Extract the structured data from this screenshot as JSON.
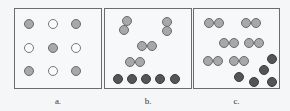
{
  "figure": {
    "panels": [
      {
        "id": "a",
        "label": "a.",
        "box": {
          "left": 14,
          "width": 88
        },
        "particles": [
          {
            "x": 14,
            "y": 15,
            "type": "gray"
          },
          {
            "x": 38,
            "y": 15,
            "type": "white"
          },
          {
            "x": 61,
            "y": 15,
            "type": "gray"
          },
          {
            "x": 14,
            "y": 39,
            "type": "white"
          },
          {
            "x": 38,
            "y": 39,
            "type": "gray"
          },
          {
            "x": 61,
            "y": 39,
            "type": "white"
          },
          {
            "x": 14,
            "y": 62,
            "type": "gray"
          },
          {
            "x": 38,
            "y": 62,
            "type": "white"
          },
          {
            "x": 61,
            "y": 62,
            "type": "gray"
          }
        ]
      },
      {
        "id": "b",
        "label": "b.",
        "box": {
          "left": 104,
          "width": 88
        },
        "particles": [
          {
            "x": 22,
            "y": 12,
            "type": "gray"
          },
          {
            "x": 19,
            "y": 21,
            "type": "gray"
          },
          {
            "x": 62,
            "y": 13,
            "type": "gray"
          },
          {
            "x": 62,
            "y": 22,
            "type": "gray"
          },
          {
            "x": 37,
            "y": 37,
            "type": "gray"
          },
          {
            "x": 47,
            "y": 37,
            "type": "gray"
          },
          {
            "x": 25,
            "y": 53,
            "type": "gray"
          },
          {
            "x": 35,
            "y": 53,
            "type": "gray"
          },
          {
            "x": 13,
            "y": 70,
            "type": "dark"
          },
          {
            "x": 27,
            "y": 70,
            "type": "dark"
          },
          {
            "x": 41,
            "y": 70,
            "type": "dark"
          },
          {
            "x": 55,
            "y": 70,
            "type": "dark"
          },
          {
            "x": 70,
            "y": 70,
            "type": "dark"
          }
        ]
      },
      {
        "id": "c",
        "label": "c.",
        "box": {
          "left": 193,
          "width": 87
        },
        "particles": [
          {
            "x": 15,
            "y": 14,
            "type": "gray"
          },
          {
            "x": 25,
            "y": 14,
            "type": "gray"
          },
          {
            "x": 52,
            "y": 14,
            "type": "gray"
          },
          {
            "x": 62,
            "y": 14,
            "type": "gray"
          },
          {
            "x": 30,
            "y": 34,
            "type": "gray"
          },
          {
            "x": 40,
            "y": 34,
            "type": "gray"
          },
          {
            "x": 55,
            "y": 34,
            "type": "gray"
          },
          {
            "x": 65,
            "y": 34,
            "type": "gray"
          },
          {
            "x": 14,
            "y": 52,
            "type": "gray"
          },
          {
            "x": 24,
            "y": 52,
            "type": "gray"
          },
          {
            "x": 40,
            "y": 52,
            "type": "gray"
          },
          {
            "x": 50,
            "y": 52,
            "type": "gray"
          },
          {
            "x": 78,
            "y": 50,
            "type": "dark"
          },
          {
            "x": 70,
            "y": 61,
            "type": "dark"
          },
          {
            "x": 45,
            "y": 68,
            "type": "dark"
          },
          {
            "x": 60,
            "y": 73,
            "type": "dark"
          },
          {
            "x": 78,
            "y": 73,
            "type": "dark"
          }
        ]
      }
    ]
  }
}
